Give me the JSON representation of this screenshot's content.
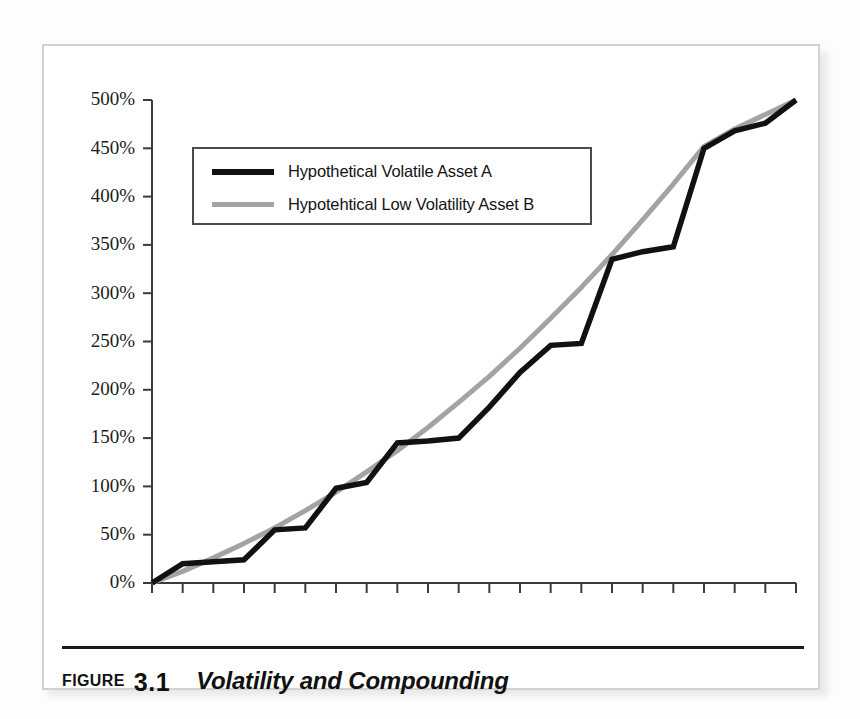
{
  "figure": {
    "label_word": "FIGURE",
    "number": "3.1",
    "title": "Volatility and Compounding"
  },
  "legend": {
    "position": "top-left-inside",
    "entries": [
      {
        "label": "Hypothetical Volatile Asset A",
        "color": "#111111"
      },
      {
        "label": "Hypotehtical Low Volatility Asset B",
        "color": "#a3a3a3"
      }
    ]
  },
  "colors": {
    "series_a": "#111111",
    "series_b": "#a3a3a3",
    "axis": "#3b3b3b",
    "frame": "#d2d2d2",
    "caption_rule": "#1a1a1a",
    "background": "#ffffff"
  },
  "chart_data": {
    "type": "line",
    "title": "Volatility and Compounding",
    "xlabel": "",
    "ylabel": "",
    "xlim": [
      0,
      21
    ],
    "ylim": [
      0,
      500
    ],
    "grid": false,
    "legend_position": "upper left",
    "y_ticks": [
      0,
      50,
      100,
      150,
      200,
      250,
      300,
      350,
      400,
      450,
      500
    ],
    "y_tick_labels": [
      "0%",
      "50%",
      "100%",
      "150%",
      "200%",
      "250%",
      "300%",
      "350%",
      "400%",
      "450%",
      "500%"
    ],
    "x_ticks": [
      0,
      1,
      2,
      3,
      4,
      5,
      6,
      7,
      8,
      9,
      10,
      11,
      12,
      13,
      14,
      15,
      16,
      17,
      18,
      19,
      20,
      21
    ],
    "x_tick_labels": [],
    "x": [
      0,
      1,
      2,
      3,
      4,
      5,
      6,
      7,
      8,
      9,
      10,
      11,
      12,
      13,
      14,
      15,
      16,
      17,
      18,
      19,
      20,
      21
    ],
    "series": [
      {
        "name": "Hypothetical Volatile Asset A",
        "color": "#111111",
        "values": [
          0,
          20,
          22,
          24,
          55,
          57,
          98,
          104,
          145,
          147,
          150,
          182,
          218,
          246,
          248,
          335,
          343,
          348,
          450,
          468,
          476,
          500
        ]
      },
      {
        "name": "Hypotehtical Low Volatility Asset B",
        "color": "#a3a3a3",
        "values": [
          0,
          12,
          26,
          41,
          57,
          75,
          94,
          115,
          137,
          161,
          187,
          214,
          243,
          274,
          306,
          340,
          376,
          413,
          452,
          470,
          485,
          500
        ]
      }
    ]
  }
}
